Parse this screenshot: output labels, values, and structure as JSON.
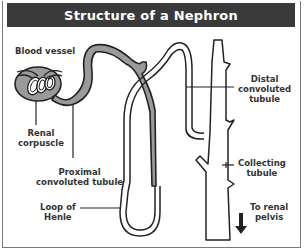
{
  "title": "Structure of a Nephron",
  "labels": {
    "blood_vessel": "Blood vessel",
    "renal_corpuscle_1": "Renal",
    "renal_corpuscle_2": "corpuscle",
    "proximal_1": "Proximal",
    "proximal_2": "convoluted tubule",
    "loop_1": "Loop of",
    "loop_2": "Henle",
    "distal_1": "Distal",
    "distal_2": "convoluted",
    "distal_3": "tubule",
    "collecting_1": "Collecting",
    "collecting_2": "tubule",
    "pelvis_1": "To renal",
    "pelvis_2": "pelvis"
  },
  "colors": {
    "title_bg": "#3a3a3a",
    "title_text": "#ffffff",
    "shaded": "#9a9a9a",
    "outline": "#222222",
    "label_text": "#333333"
  }
}
